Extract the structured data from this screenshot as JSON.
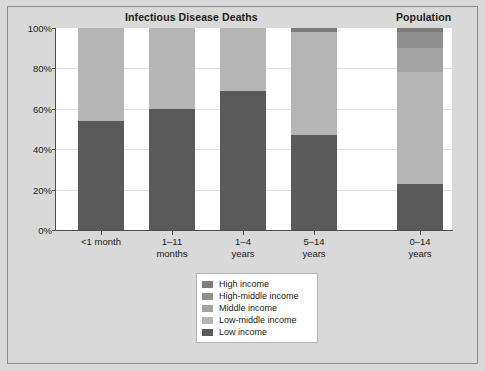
{
  "figure": {
    "background_color": "#d9d9d9",
    "plot_background_color": "#ffffff",
    "border_color": "#8c8c8c"
  },
  "titles": {
    "deaths": "Infectious Disease Deaths",
    "population": "Population"
  },
  "legend": {
    "position": "bottom-center",
    "items": [
      {
        "label": "High income",
        "color": "#7d7d7d"
      },
      {
        "label": "High-middle income",
        "color": "#8f8f8f"
      },
      {
        "label": "Middle income",
        "color": "#a3a3a3"
      },
      {
        "label": "Low-middle income",
        "color": "#b5b5b5"
      },
      {
        "label": "Low income",
        "color": "#5a5a5a"
      }
    ]
  },
  "chart_data": {
    "type": "bar",
    "subtype": "stacked-100-percent",
    "title": "Infectious Disease Deaths",
    "secondary_title": "Population",
    "xlabel": "",
    "ylabel": "",
    "ylim": [
      0,
      100
    ],
    "ytick_labels": [
      "0%",
      "20%",
      "40%",
      "60%",
      "80%",
      "100%"
    ],
    "ytick_values": [
      0,
      20,
      40,
      60,
      80,
      100
    ],
    "grid": true,
    "categories": [
      "<1 month",
      "1–11 months",
      "1–4 years",
      "5–14 years",
      "0–14 years"
    ],
    "category_lines": [
      [
        "<1 month"
      ],
      [
        "1–11",
        "months"
      ],
      [
        "1–4",
        "years"
      ],
      [
        "5–14",
        "years"
      ],
      [
        "0–14",
        "years"
      ]
    ],
    "category_panel": [
      "deaths",
      "deaths",
      "deaths",
      "deaths",
      "population"
    ],
    "series": [
      {
        "name": "Low income",
        "color": "#5a5a5a",
        "values": [
          54,
          60,
          69,
          47,
          23
        ]
      },
      {
        "name": "Low-middle income",
        "color": "#b5b5b5",
        "values": [
          46,
          40,
          31,
          51,
          55
        ]
      },
      {
        "name": "Middle income",
        "color": "#a3a3a3",
        "values": [
          0,
          0,
          0,
          0,
          12
        ]
      },
      {
        "name": "High-middle income",
        "color": "#8f8f8f",
        "values": [
          0,
          0,
          0,
          0,
          8
        ]
      },
      {
        "name": "High income",
        "color": "#7d7d7d",
        "values": [
          0,
          0,
          0,
          2,
          2
        ]
      }
    ],
    "stack_order_bottom_to_top": [
      "Low income",
      "Low-middle income",
      "Middle income",
      "High-middle income",
      "High income"
    ]
  }
}
